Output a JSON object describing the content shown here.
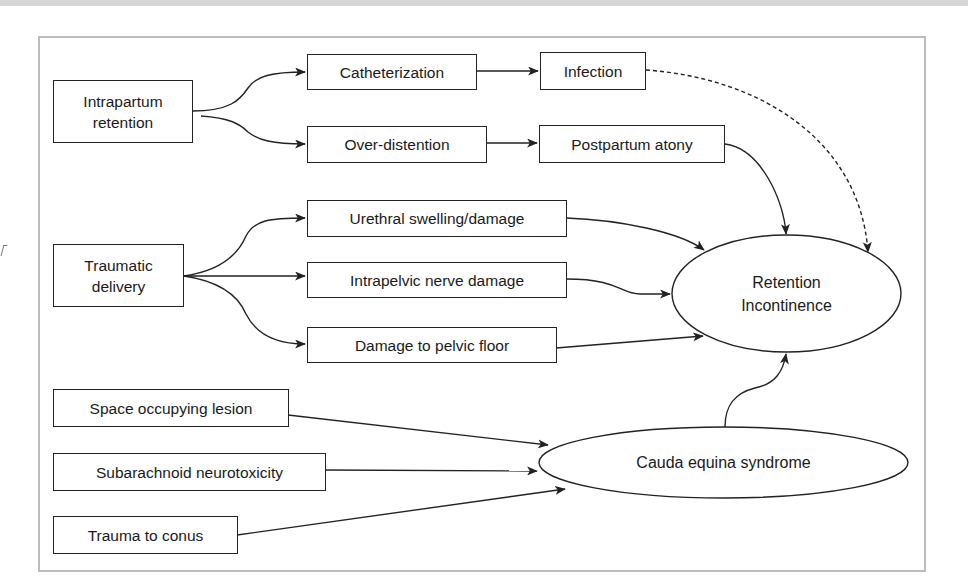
{
  "diagram": {
    "title": "",
    "nodes": {
      "intrapartum_retention": {
        "label_line1": "Intrapartum",
        "label_line2": "retention"
      },
      "catheterization": {
        "label": "Catheterization"
      },
      "infection": {
        "label": "Infection"
      },
      "over_distention": {
        "label": "Over-distention"
      },
      "postpartum_atony": {
        "label": "Postpartum atony"
      },
      "traumatic_delivery": {
        "label_line1": "Traumatic",
        "label_line2": "delivery"
      },
      "urethral_swelling": {
        "label": "Urethral swelling/damage"
      },
      "intrapelvic_nerve": {
        "label": "Intrapelvic nerve damage"
      },
      "pelvic_floor": {
        "label": "Damage to pelvic floor"
      },
      "retention_incontinence": {
        "label_line1": "Retention",
        "label_line2": "Incontinence"
      },
      "space_occupying": {
        "label": "Space occupying lesion"
      },
      "subarachnoid": {
        "label": "Subarachnoid neurotoxicity"
      },
      "trauma_conus": {
        "label": "Trauma to conus"
      },
      "cauda_equina": {
        "label": "Cauda equina syndrome"
      }
    },
    "edges": [
      {
        "from": "Intrapartum retention",
        "to": "Catheterization",
        "style": "solid"
      },
      {
        "from": "Intrapartum retention",
        "to": "Over-distention",
        "style": "solid"
      },
      {
        "from": "Catheterization",
        "to": "Infection",
        "style": "solid"
      },
      {
        "from": "Over-distention",
        "to": "Postpartum atony",
        "style": "solid"
      },
      {
        "from": "Infection",
        "to": "Retention Incontinence",
        "style": "dashed"
      },
      {
        "from": "Postpartum atony",
        "to": "Retention Incontinence",
        "style": "solid"
      },
      {
        "from": "Traumatic delivery",
        "to": "Urethral swelling/damage",
        "style": "solid"
      },
      {
        "from": "Traumatic delivery",
        "to": "Intrapelvic nerve damage",
        "style": "solid"
      },
      {
        "from": "Traumatic delivery",
        "to": "Damage to pelvic floor",
        "style": "solid"
      },
      {
        "from": "Urethral swelling/damage",
        "to": "Retention Incontinence",
        "style": "solid"
      },
      {
        "from": "Intrapelvic nerve damage",
        "to": "Retention Incontinence",
        "style": "solid"
      },
      {
        "from": "Damage to pelvic floor",
        "to": "Retention Incontinence",
        "style": "solid"
      },
      {
        "from": "Space occupying lesion",
        "to": "Cauda equina syndrome",
        "style": "solid"
      },
      {
        "from": "Subarachnoid neurotoxicity",
        "to": "Cauda equina syndrome",
        "style": "solid"
      },
      {
        "from": "Trauma to conus",
        "to": "Cauda equina syndrome",
        "style": "solid"
      },
      {
        "from": "Cauda equina syndrome",
        "to": "Retention Incontinence",
        "style": "solid"
      }
    ],
    "colors": {
      "line": "#222222",
      "frame": "#bdbdbd",
      "top_band": "#d6d6d6",
      "background": "#ffffff"
    }
  }
}
